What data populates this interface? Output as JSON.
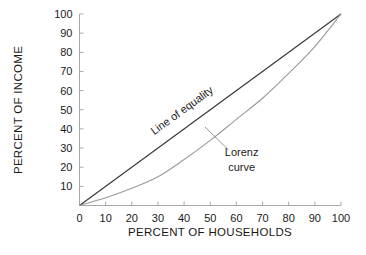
{
  "chart_data": {
    "type": "line",
    "title": "",
    "xlabel": "PERCENT OF HOUSEHOLDS",
    "ylabel": "PERCENT OF INCOME",
    "xlim": [
      0,
      100
    ],
    "ylim": [
      0,
      100
    ],
    "xticks": [
      "0",
      "10",
      "20",
      "30",
      "40",
      "50",
      "60",
      "70",
      "80",
      "90",
      "100"
    ],
    "yticks": [
      "10",
      "20",
      "30",
      "40",
      "50",
      "60",
      "70",
      "80",
      "90",
      "100"
    ],
    "grid": false,
    "legend_position": "inline-annotations",
    "series": [
      {
        "name": "Line of equality",
        "color": "#333333",
        "x": [
          0,
          10,
          20,
          30,
          40,
          50,
          60,
          70,
          80,
          90,
          100
        ],
        "values": [
          0,
          10,
          20,
          30,
          40,
          50,
          60,
          70,
          80,
          90,
          100
        ]
      },
      {
        "name": "Lorenz curve",
        "color": "#9a9a9a",
        "x": [
          0,
          10,
          20,
          30,
          40,
          50,
          60,
          70,
          80,
          90,
          100
        ],
        "values": [
          0,
          4,
          9,
          15,
          24,
          34,
          45,
          56,
          69,
          83,
          100
        ]
      }
    ],
    "annotations": [
      {
        "name": "line-of-equality-label",
        "text": "Line of equality",
        "rotation": -36,
        "x": 40,
        "y": 48
      },
      {
        "name": "lorenz-curve-label",
        "line1": "Lorenz",
        "line2": "curve",
        "x": 62,
        "y": 26,
        "leader_from_x": 48,
        "leader_from_y": 41,
        "leader_to_x": 57,
        "leader_to_y": 29
      }
    ]
  },
  "axis": {
    "spine_color": "#a8a8a8",
    "tick_color": "#a8a8a8"
  }
}
